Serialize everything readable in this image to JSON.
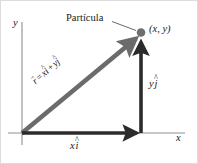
{
  "figure": {
    "background_color": "#ffffff",
    "width": 198,
    "height": 164
  },
  "colors": {
    "axis": "#8f8f8f",
    "vector_component": "#2b2b2b",
    "vector_resultant": "#6b6b6b",
    "point": "#6e6e6e",
    "leader_line": "#5a5a5a",
    "text": "#1a1a1a",
    "border": "#d8d8d8"
  },
  "axes": {
    "origin": {
      "x": 22,
      "y": 133
    },
    "x_axis": {
      "label": "x",
      "from_x": 8,
      "to_x": 185,
      "y": 133
    },
    "y_axis": {
      "label": "y",
      "x": 22,
      "from_y": 22,
      "to_y": 145
    }
  },
  "labels": {
    "particle": "Partícula",
    "coordinates": "(x, y)",
    "x_component": {
      "scalar": "x",
      "unit_vector": "i",
      "accent": "hat"
    },
    "y_component": {
      "scalar": "y",
      "unit_vector": "j",
      "accent": "hat"
    },
    "position_vector": {
      "symbol": "r",
      "symbol_accent": "arrow",
      "equals": "=",
      "term1_scalar": "x",
      "term1_unit": "i",
      "plus": "+",
      "term2_scalar": "y",
      "term2_unit": "j"
    }
  },
  "vectors": [
    {
      "name": "x-component-vector",
      "label": "xi",
      "from": {
        "x": 22,
        "y": 133
      },
      "to": {
        "x": 141,
        "y": 133
      },
      "color": "#2b2b2b",
      "width": 4
    },
    {
      "name": "y-component-vector",
      "label": "yj",
      "from": {
        "x": 141,
        "y": 133
      },
      "to": {
        "x": 141,
        "y": 36
      },
      "color": "#2b2b2b",
      "width": 4
    },
    {
      "name": "position-vector",
      "label": "r = xi + yj",
      "from": {
        "x": 22,
        "y": 133
      },
      "to": {
        "x": 139,
        "y": 36
      },
      "color": "#6b6b6b",
      "width": 5
    }
  ],
  "point": {
    "name": "particle-point",
    "x": 141,
    "y": 33,
    "radius": 4.2,
    "color": "#6e6e6e"
  },
  "leader": {
    "from": {
      "x": 113,
      "y": 22
    },
    "to": {
      "x": 136,
      "y": 31
    }
  }
}
